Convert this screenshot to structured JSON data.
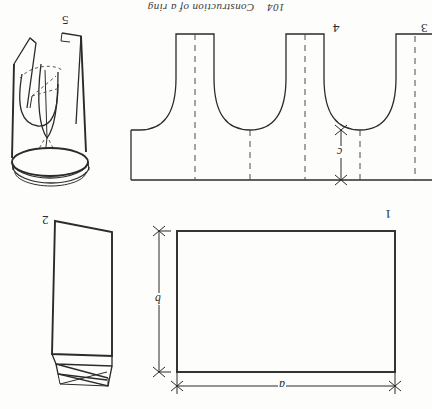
{
  "page": {
    "width": 432,
    "height": 409,
    "background_color": "#fdfdfc",
    "ink_color": "#2b2b2b",
    "orientation_note": "upside-down",
    "running_head": "104    Construction of a ring",
    "page_number": "104",
    "chapter_title": "Construction of a ring"
  },
  "figures": {
    "fig1": {
      "label": "1",
      "caption": "rectangle blank",
      "dimension_width_label": "a",
      "dimension_height_label": "b"
    },
    "fig2": {
      "label": "2",
      "caption": "rolled sheet"
    },
    "fig3": {
      "label": "3",
      "caption": "pattern continuation"
    },
    "fig4": {
      "label": "4",
      "caption": "scalloped strip pattern",
      "dimension_label": "c"
    },
    "fig5": {
      "label": "5",
      "caption": "formed ring with tapered tongue"
    }
  }
}
